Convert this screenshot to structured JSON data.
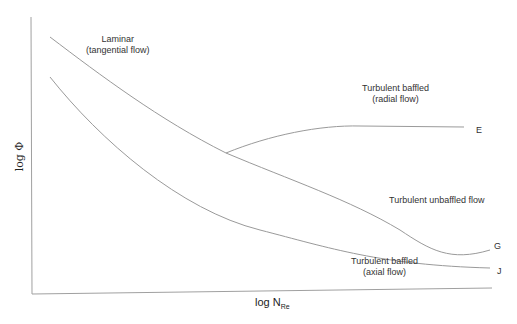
{
  "diagram": {
    "axes": {
      "x_label_main": "log N",
      "x_label_sub": "Re",
      "y_label": "log Φ"
    },
    "curve_labels": {
      "laminar_line1": "Laminar",
      "laminar_line2": "(tangential flow)",
      "radial_line1": "Turbulent baffled",
      "radial_line2": "(radial flow)",
      "unbaffled": "Turbulent unbaffled flow",
      "axial_line1": "Turbulent baffled",
      "axial_line2": "(axial flow)"
    },
    "endpoints": {
      "E": "E",
      "G": "G",
      "J": "J"
    },
    "colors": {
      "line": "#9a9a9a",
      "text": "#333333"
    }
  }
}
